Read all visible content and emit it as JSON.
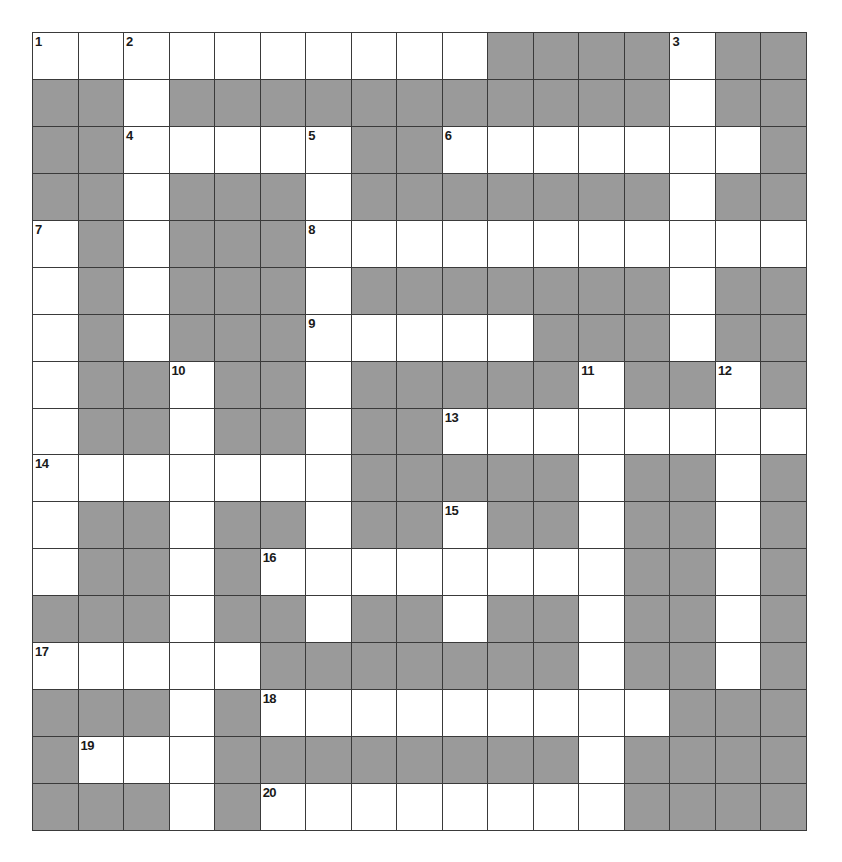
{
  "puzzle": {
    "rows": 17,
    "cols": 17,
    "colors": {
      "white_cell": "#ffffff",
      "block_cell": "#9a9a9a",
      "grid_line": "#3a3a3a",
      "number": "#1a1a1a"
    },
    "grid": [
      "WWWWWWWWWW####W##",
      "##W###########W##",
      "##WWWWW##WWWWWWW#",
      "##W###W#######W##",
      "W#W###WWWWWWWWWWW",
      "W#W###W#######W##",
      "W#W###WWWWW###W##",
      "W##W##W#####W##W#",
      "W##W##W##WWWWWWWW",
      "WWWWWWW#####W##W#",
      "W##W##W##W##W##W#",
      "W##W#WWWWWWWW##W#",
      "###W##W##W##W##W#",
      "WWWWW#######W##W#",
      "###W#WWWWWWWWW###",
      "#WWW########W####",
      "###W#WWWWWWWW####"
    ],
    "numbers": [
      {
        "n": "1",
        "row": 0,
        "col": 0
      },
      {
        "n": "2",
        "row": 0,
        "col": 2
      },
      {
        "n": "3",
        "row": 0,
        "col": 14
      },
      {
        "n": "4",
        "row": 2,
        "col": 2
      },
      {
        "n": "5",
        "row": 2,
        "col": 6
      },
      {
        "n": "6",
        "row": 2,
        "col": 9
      },
      {
        "n": "7",
        "row": 4,
        "col": 0
      },
      {
        "n": "8",
        "row": 4,
        "col": 6
      },
      {
        "n": "9",
        "row": 6,
        "col": 6
      },
      {
        "n": "10",
        "row": 7,
        "col": 3
      },
      {
        "n": "11",
        "row": 7,
        "col": 12
      },
      {
        "n": "12",
        "row": 7,
        "col": 15
      },
      {
        "n": "13",
        "row": 8,
        "col": 9
      },
      {
        "n": "14",
        "row": 9,
        "col": 0
      },
      {
        "n": "15",
        "row": 10,
        "col": 9
      },
      {
        "n": "16",
        "row": 11,
        "col": 5
      },
      {
        "n": "17",
        "row": 13,
        "col": 0
      },
      {
        "n": "18",
        "row": 14,
        "col": 5
      },
      {
        "n": "19",
        "row": 15,
        "col": 1
      },
      {
        "n": "20",
        "row": 16,
        "col": 5
      }
    ]
  }
}
